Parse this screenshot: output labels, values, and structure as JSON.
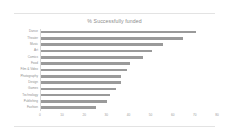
{
  "chart_data": {
    "type": "bar",
    "orientation": "horizontal",
    "title": "% Successfully funded",
    "xlabel": "",
    "ylabel": "",
    "xlim": [
      0,
      80
    ],
    "xticks": [
      0,
      10,
      20,
      30,
      40,
      50,
      60,
      70,
      80
    ],
    "grid": false,
    "legend": false,
    "bar_color": "#9a9a9a",
    "categories": [
      "Dance",
      "Theater",
      "Music",
      "Art",
      "Comics",
      "Food",
      "Film & Video",
      "Photography",
      "Design",
      "Games",
      "Technology",
      "Publishing",
      "Fashion"
    ],
    "values": [
      70,
      64,
      55,
      50,
      46,
      40,
      39,
      36,
      36,
      34,
      31,
      30,
      25
    ]
  },
  "chart": {
    "title": "% Successfully funded"
  }
}
